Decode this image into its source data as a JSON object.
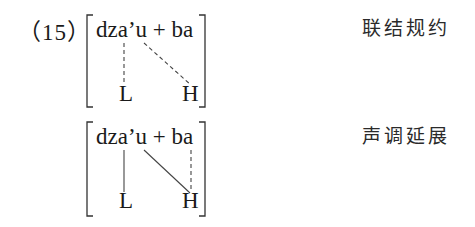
{
  "example": {
    "number_label": "（15）"
  },
  "diagrams": [
    {
      "segments": "dza’u + ba",
      "tones": [
        "L",
        "H"
      ],
      "gloss": "联结规约",
      "associations": [
        {
          "from": "a (dza)",
          "to": "L",
          "style": "dashed"
        },
        {
          "from": "u",
          "to": "H",
          "style": "dashed"
        }
      ]
    },
    {
      "segments": "dza’u + ba",
      "tones": [
        "L",
        "H"
      ],
      "gloss": "声调延展",
      "associations": [
        {
          "from": "a (dza)",
          "to": "L",
          "style": "solid"
        },
        {
          "from": "u",
          "to": "H",
          "style": "solid"
        },
        {
          "from": "a (ba)",
          "to": "H",
          "style": "dashed"
        }
      ]
    }
  ]
}
